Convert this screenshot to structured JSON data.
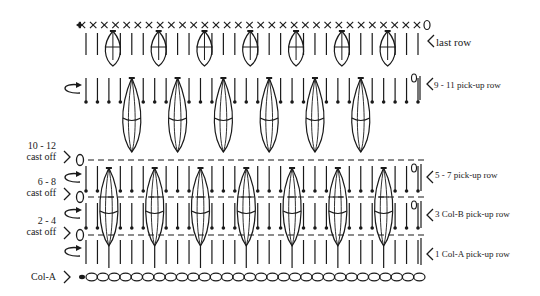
{
  "diagram": {
    "stroke_color": "#1a1a1a",
    "background": "#ffffff",
    "right_labels": [
      {
        "text": "last row",
        "x": 436,
        "y": 36,
        "size": "big"
      },
      {
        "text": "9 - 11 pick-up row",
        "x": 434,
        "y": 80,
        "size": "small"
      },
      {
        "text": "5 - 7 pick-up row",
        "x": 435,
        "y": 170,
        "size": "small"
      },
      {
        "text": "3 Col-B pick-up row",
        "x": 435,
        "y": 209,
        "size": "small"
      },
      {
        "text": "1 Col-A pick-up row",
        "x": 435,
        "y": 249,
        "size": "small"
      }
    ],
    "left_labels": [
      {
        "line1": "10 - 12",
        "line2": "cast off",
        "x": 8,
        "y": 150
      },
      {
        "line1": "6 - 8",
        "line2": "cast off",
        "x": 8,
        "y": 186
      },
      {
        "line1": "2 - 4",
        "line2": "cast off",
        "x": 8,
        "y": 225
      },
      {
        "line1": "Col-A",
        "line2": "",
        "x": 8,
        "y": 277
      }
    ],
    "rows": {
      "last_row": {
        "x_start": 82,
        "x_end": 425,
        "count": 31,
        "y": 25
      },
      "chain_row": {
        "x_start": 82,
        "x_end": 425,
        "count": 30,
        "y": 277
      },
      "dashed_rows_y": [
        160,
        197,
        235
      ],
      "cast_off_circles_y": [
        160,
        197,
        235
      ]
    },
    "symbols": {
      "single_crochet": "×",
      "chain": "oval",
      "slip_stitch": "•",
      "start_arrow": "◀",
      "turn_arrow": "curved-arrow",
      "pointer": "<",
      "chain_loop": "0"
    }
  }
}
